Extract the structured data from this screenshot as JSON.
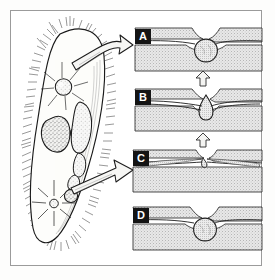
{
  "figure": {
    "background_color": "#fdfdfc",
    "frame_color": "#9b9b9b",
    "ink_color": "#1a1a1a",
    "stipple_color": "#8d8d8d",
    "badge_background": "#141414",
    "badge_text_color": "#ffffff"
  },
  "organism": {
    "name": "ciliate-cell",
    "label": "",
    "outline_color": "#1a1a1a",
    "cilia_description": "dense hair-like cilia around cell margin",
    "organelles": [
      {
        "name": "contractile-vacuole-upper",
        "label": "",
        "shape": "radiating-star-vacuole"
      },
      {
        "name": "macronucleus",
        "label": "",
        "shape": "kidney-bean"
      },
      {
        "name": "micronucleus",
        "label": "",
        "shape": "small-dark-oval"
      },
      {
        "name": "food-vacuole-chain",
        "label": "",
        "shape": "elongated-lobed-sac"
      },
      {
        "name": "contractile-vacuole-lower",
        "label": "",
        "shape": "radiating-star-vacuole"
      }
    ]
  },
  "pointer_arrows": [
    {
      "name": "callout-arrow-upper",
      "label": "",
      "direction": "right"
    },
    {
      "name": "callout-arrow-lower",
      "label": "",
      "direction": "right"
    }
  ],
  "sequence_arrows": [
    {
      "name": "sequence-arrow-b-to-a",
      "label": "",
      "direction": "up"
    },
    {
      "name": "sequence-arrow-c-to-b",
      "label": "",
      "direction": "up"
    }
  ],
  "panels": [
    {
      "letter": "A",
      "name": "panel-a",
      "caption": "",
      "stage": "filled vesicle docked beneath membrane pore",
      "vesicle_shape": "round-full"
    },
    {
      "letter": "B",
      "name": "panel-b",
      "caption": "",
      "stage": "vesicle fused with membrane, contents expelled",
      "vesicle_shape": "teardrop-discharging"
    },
    {
      "letter": "C",
      "name": "panel-c",
      "caption": "",
      "stage": "vesicle collapsed and emptied, pore open",
      "vesicle_shape": "collapsed"
    },
    {
      "letter": "D",
      "name": "panel-d",
      "caption": "",
      "stage": "vesicle refilled, pore closed",
      "vesicle_shape": "round-full"
    }
  ]
}
